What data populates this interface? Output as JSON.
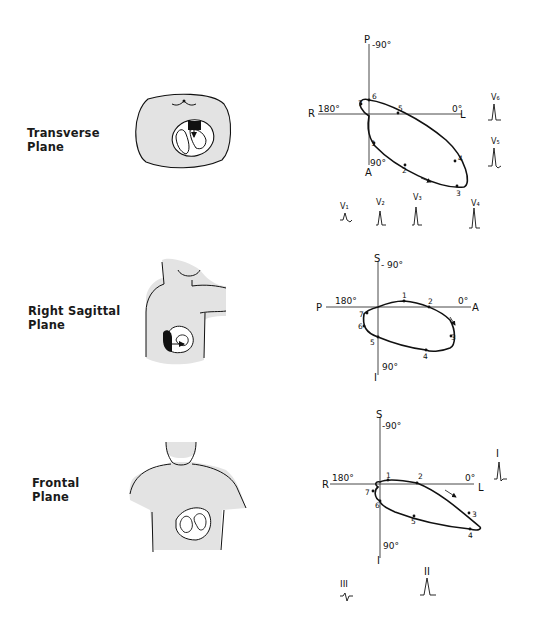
{
  "figure": {
    "panels": [
      {
        "id": "transverse",
        "label_line1": "Transverse",
        "label_line2": "Plane",
        "axes": {
          "top": "P",
          "top_angle": "-90°",
          "left": "R",
          "left_angle": "180°",
          "right": "L",
          "right_angle": "0°",
          "bottom": "A",
          "bottom_angle": "90°"
        },
        "loop_points": [
          "1",
          "2",
          "3",
          "4",
          "5",
          "6",
          "7"
        ],
        "leads": [
          "V1",
          "V2",
          "V3",
          "V4",
          "V5",
          "V6"
        ]
      },
      {
        "id": "right-sagittal",
        "label_line1": "Right Sagittal",
        "label_line2": "Plane",
        "axes": {
          "top": "S",
          "top_angle": "- 90°",
          "left": "P",
          "left_angle": "180°",
          "right": "A",
          "right_angle": "0°",
          "bottom": "I",
          "bottom_angle": "90°"
        },
        "loop_points": [
          "1",
          "2",
          "3",
          "4",
          "5",
          "6",
          "7"
        ]
      },
      {
        "id": "frontal",
        "label_line1": "Frontal",
        "label_line2": "Plane",
        "axes": {
          "top": "S",
          "top_angle": "-90°",
          "left": "R",
          "left_angle": "180°",
          "right": "L",
          "right_angle": "0°",
          "bottom": "I",
          "bottom_angle": "90°"
        },
        "loop_points": [
          "1",
          "2",
          "3",
          "4",
          "5",
          "6",
          "7"
        ],
        "leads": [
          "I",
          "II",
          "III"
        ]
      }
    ]
  }
}
